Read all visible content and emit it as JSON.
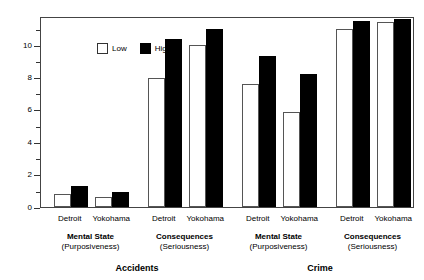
{
  "chart_data": {
    "type": "bar",
    "title": "",
    "xlabel": "",
    "ylabel": "",
    "ylim": [
      0,
      11.8
    ],
    "grid": false,
    "legend_position": "top-left",
    "y_major_ticks": [
      0,
      2,
      4,
      6,
      8,
      10
    ],
    "y_tick_labels": [
      "0",
      "2",
      "4",
      "6",
      "8",
      "10"
    ],
    "y_minor_ticks": [
      1,
      3,
      5,
      7,
      9,
      11
    ],
    "legend": [
      {
        "name": "Low",
        "swatch": "white-square"
      },
      {
        "name": "High",
        "swatch": "black-square"
      }
    ],
    "series": [
      {
        "name": "Low",
        "values": [
          0.8,
          0.6,
          8.0,
          10.0,
          7.6,
          5.9,
          11.0,
          11.4
        ]
      },
      {
        "name": "High",
        "values": [
          1.3,
          0.9,
          10.4,
          11.0,
          9.3,
          8.2,
          11.5,
          11.6
        ]
      }
    ],
    "categories": [
      "Detroit",
      "Yokohama",
      "Detroit",
      "Yokohama",
      "Detroit",
      "Yokohama",
      "Detroit",
      "Yokohama"
    ],
    "measures": [
      {
        "label": "Mental State",
        "sublabel": "(Purposiveness)"
      },
      {
        "label": "Consequences",
        "sublabel": "(Seriousness)"
      },
      {
        "label": "Mental State",
        "sublabel": "(Purposiveness)"
      },
      {
        "label": "Consequences",
        "sublabel": "(Seriousness)"
      }
    ],
    "domains": [
      "Accidents",
      "Crime"
    ],
    "colors": {
      "low": "#ffffff",
      "high": "#000000",
      "axis": "#444444",
      "text": "#000000",
      "background": "#ffffff"
    }
  }
}
